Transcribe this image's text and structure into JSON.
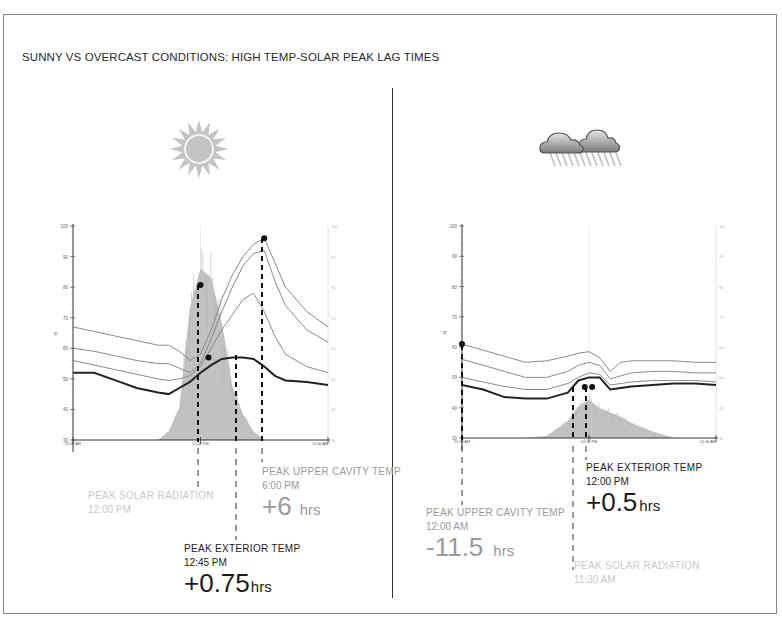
{
  "title": "SUNNY VS OVERCAST CONDITIONS: HIGH TEMP-SOLAR PEAK LAG TIMES",
  "panels": {
    "sunny": {
      "icon": "sun-icon",
      "labels": {
        "solar": {
          "name": "PEAK SOLAR RADIATION",
          "time": "12:00 PM"
        },
        "upper": {
          "name": "PEAK UPPER CAVITY TEMP",
          "time": "6:00 PM",
          "lag": "+6",
          "unit": "hrs"
        },
        "exterior": {
          "name": "PEAK EXTERIOR TEMP",
          "time": "12:45 PM",
          "lag": "+0.75",
          "unit": "hrs"
        }
      }
    },
    "overcast": {
      "icon": "rain-cloud-icon",
      "labels": {
        "exterior": {
          "name": "PEAK EXTERIOR TEMP",
          "time": "12:00 PM",
          "lag": "+0.5",
          "unit": "hrs"
        },
        "upper": {
          "name": "PEAK UPPER CAVITY TEMP",
          "time": "12:00 AM",
          "lag": "-11.5",
          "unit": "hrs"
        },
        "solar": {
          "name": "PEAK SOLAR RADIATION",
          "time": "11:30 AM"
        }
      }
    }
  },
  "chart_data": [
    {
      "type": "line",
      "title": "Sunny",
      "xlabel": "Time of day",
      "ylabel": "°F",
      "ylim": [
        30,
        100
      ],
      "yticks": [
        30,
        40,
        50,
        60,
        70,
        80,
        90,
        100
      ],
      "x_ticks": [
        "12:00 AM",
        "12:00 PM",
        "12:00 AM"
      ],
      "x": [
        0,
        2,
        4,
        6,
        8,
        9,
        10,
        11,
        12,
        13,
        14,
        15,
        16,
        17,
        18,
        19,
        20,
        22,
        24
      ],
      "series": [
        {
          "name": "Upper Cavity Temp",
          "values": [
            67,
            65.5,
            64,
            62.5,
            61,
            61,
            59,
            56,
            58,
            66,
            76,
            84,
            90,
            94,
            96,
            88,
            80,
            72,
            67
          ]
        },
        {
          "name": "Mid Cavity Temp 1",
          "values": [
            60,
            59,
            57.5,
            56,
            55,
            55,
            53.5,
            52,
            55,
            63,
            72,
            80,
            87,
            91,
            92,
            82,
            74,
            66,
            62
          ]
        },
        {
          "name": "Mid Cavity Temp 2",
          "values": [
            56,
            54.5,
            53,
            51.5,
            50,
            49.5,
            50,
            51,
            54,
            60,
            66,
            71,
            76,
            78,
            72,
            64,
            58,
            54,
            52
          ]
        },
        {
          "name": "Exterior Temp",
          "values": [
            52,
            52,
            49.5,
            47,
            45.5,
            45,
            47,
            49,
            52,
            54.5,
            56.5,
            57,
            57,
            56.5,
            54,
            51,
            49.5,
            49,
            48
          ]
        },
        {
          "name": "Solar Radiation",
          "values": [
            0,
            0,
            0,
            0,
            0,
            4,
            15,
            62,
            80,
            76,
            55,
            25,
            12,
            4,
            0,
            0,
            0,
            0,
            0
          ]
        }
      ],
      "peaks": [
        {
          "series": "Solar Radiation",
          "time": "12:00 PM"
        },
        {
          "series": "Exterior Temp",
          "time": "12:45 PM",
          "lag_hrs": 0.75
        },
        {
          "series": "Upper Cavity Temp",
          "time": "6:00 PM",
          "lag_hrs": 6
        }
      ]
    },
    {
      "type": "line",
      "title": "Overcast",
      "xlabel": "Time of day",
      "ylabel": "°F",
      "ylim": [
        30,
        100
      ],
      "yticks": [
        30,
        40,
        50,
        60,
        70,
        80,
        90,
        100
      ],
      "x_ticks": [
        "12:00 AM",
        "12:00 PM",
        "12:00 AM"
      ],
      "x": [
        0,
        2,
        4,
        6,
        8,
        10,
        11,
        12,
        13,
        14,
        15,
        16,
        18,
        20,
        22,
        24
      ],
      "series": [
        {
          "name": "Upper Cavity Temp",
          "values": [
            61,
            59,
            57,
            55,
            55.5,
            57,
            58,
            58.5,
            56.5,
            52,
            55,
            55.5,
            55.5,
            55.5,
            55,
            55
          ]
        },
        {
          "name": "Mid Cavity Temp 1",
          "values": [
            56,
            54,
            52,
            50,
            50,
            52,
            54,
            55,
            54,
            49.5,
            50.5,
            51.5,
            52,
            52,
            51.5,
            51.5
          ]
        },
        {
          "name": "Mid Cavity Temp 2",
          "values": [
            50,
            48.5,
            47,
            46,
            46,
            48,
            50,
            51.5,
            51,
            47.5,
            48,
            48.5,
            49,
            49,
            49,
            48.5
          ]
        },
        {
          "name": "Exterior Temp",
          "values": [
            47.5,
            46,
            43.5,
            43,
            43,
            45,
            49,
            50,
            50,
            46,
            46.5,
            47,
            47.5,
            48,
            48,
            47.5
          ]
        },
        {
          "name": "Solar Radiation",
          "values": [
            0,
            0,
            0,
            0,
            1,
            8,
            15,
            18,
            14,
            12,
            10,
            7,
            3,
            0,
            0,
            0
          ]
        }
      ],
      "peaks": [
        {
          "series": "Upper Cavity Temp",
          "time": "12:00 AM",
          "lag_hrs": -11.5
        },
        {
          "series": "Exterior Temp",
          "time": "12:00 PM",
          "lag_hrs": 0.5
        },
        {
          "series": "Solar Radiation",
          "time": "11:30 AM"
        }
      ]
    }
  ]
}
